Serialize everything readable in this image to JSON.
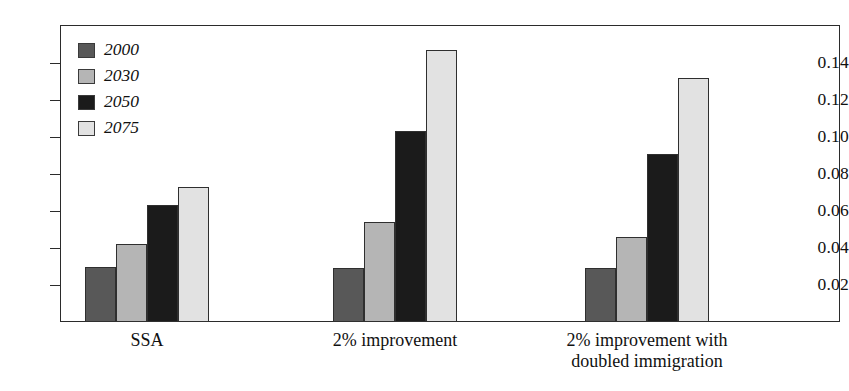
{
  "chart_data": {
    "type": "bar",
    "title": "",
    "xlabel": "",
    "ylabel": "",
    "categories": [
      "SSA",
      "2% improvement",
      "2% improvement with\ndoubled immigration"
    ],
    "series": [
      {
        "name": "2000",
        "color": "#585858",
        "values": [
          0.03,
          0.029,
          0.029
        ]
      },
      {
        "name": "2030",
        "color": "#b5b5b5",
        "values": [
          0.042,
          0.054,
          0.046
        ]
      },
      {
        "name": "2050",
        "color": "#1b1b1b",
        "values": [
          0.063,
          0.103,
          0.091
        ]
      },
      {
        "name": "2075",
        "color": "#e2e2e2",
        "values": [
          0.073,
          0.147,
          0.132
        ]
      }
    ],
    "ylim": [
      0,
      0.155
    ],
    "yticks": [
      0.02,
      0.04,
      0.06,
      0.08,
      0.1,
      0.12,
      0.14
    ],
    "ytick_labels": [
      "0.02",
      "0.04",
      "0.06",
      "0.08",
      "0.10",
      "0.12",
      "0.14"
    ],
    "grid": false,
    "legend_position": "top-left",
    "legend_entries": [
      "2000",
      "2030",
      "2050",
      "2075"
    ],
    "axis_color": "#2b2b2b",
    "background_color": "#ffffff"
  },
  "layout": {
    "plot_left": 60,
    "plot_top": 25,
    "plot_width": 780,
    "plot_height": 297,
    "baseline_y": 322,
    "pixels_per_unit": 1850,
    "bar_width": 31,
    "group_starts": [
      85,
      333,
      585
    ]
  }
}
